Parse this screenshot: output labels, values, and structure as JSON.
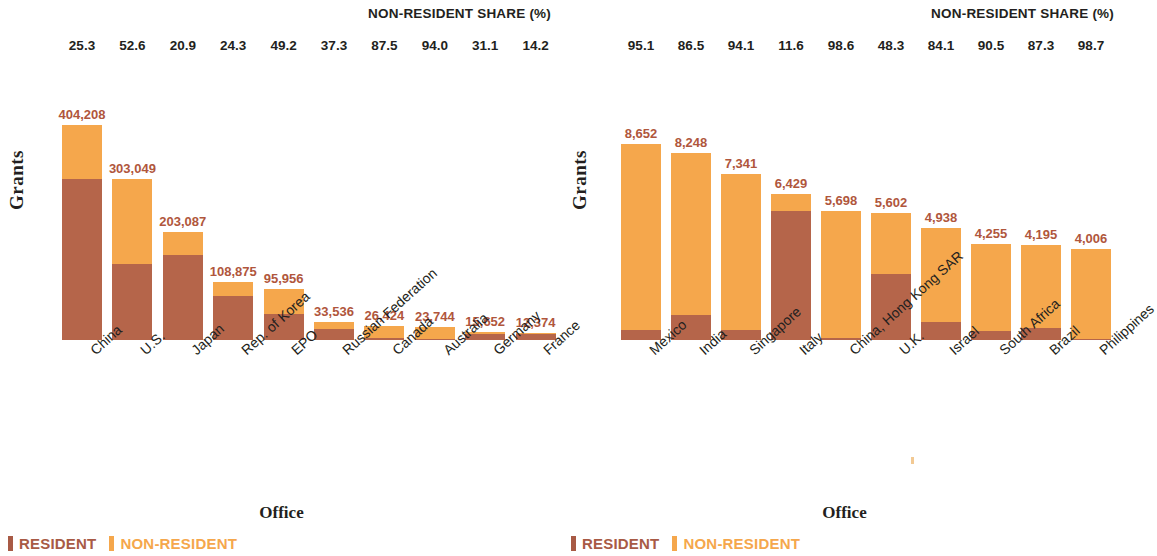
{
  "chart_data": [
    {
      "type": "bar",
      "title": "NON-RESIDENT SHARE (%)",
      "xlabel": "Office",
      "ylabel": "Grants",
      "stacked": true,
      "ylim": [
        0,
        460000
      ],
      "grid": false,
      "legend_position": "bottom-left",
      "legend": [
        "RESIDENT",
        "NON-RESIDENT"
      ],
      "colors": {
        "resident": "#b5654a",
        "non_resident": "#f5a74c"
      },
      "categories": [
        "China",
        "U.S.",
        "Japan",
        "Rep. of Korea",
        "EPO",
        "Russian Federation",
        "Canada",
        "Australia",
        "Germany",
        "France"
      ],
      "totals": [
        404208,
        303049,
        203087,
        108875,
        95956,
        33536,
        26424,
        23744,
        15652,
        12374
      ],
      "total_labels": [
        "404,208",
        "303,049",
        "203,087",
        "108,875",
        "95,956",
        "33,536",
        "26,424",
        "23,744",
        "15,652",
        "12,374"
      ],
      "non_resident_share": [
        25.3,
        52.6,
        20.9,
        24.3,
        49.2,
        37.3,
        87.5,
        94.0,
        31.1,
        14.2
      ],
      "share_labels": [
        "25.3",
        "52.6",
        "20.9",
        "24.3",
        "49.2",
        "37.3",
        "87.5",
        "94.0",
        "31.1",
        "14.2"
      ],
      "series": [
        {
          "name": "RESIDENT",
          "values": [
            301944,
            143645,
            160642,
            82418,
            48746,
            21027,
            3303,
            1425,
            10784,
            10617
          ]
        },
        {
          "name": "NON-RESIDENT",
          "values": [
            102264,
            159404,
            42445,
            26457,
            47210,
            12509,
            23121,
            22319,
            4868,
            1757
          ]
        }
      ]
    },
    {
      "type": "bar",
      "title": "NON-RESIDENT SHARE (%)",
      "xlabel": "Office",
      "ylabel": "Grants",
      "stacked": true,
      "ylim": [
        0,
        9800
      ],
      "grid": false,
      "legend_position": "bottom-left",
      "legend": [
        "RESIDENT",
        "NON-RESIDENT"
      ],
      "colors": {
        "resident": "#b5654a",
        "non_resident": "#f5a74c"
      },
      "categories": [
        "Mexico",
        "India",
        "Singapore",
        "Italy",
        "China, Hong Kong SAR",
        "U.K.",
        "Israel",
        "South Africa",
        "Brazil",
        "Philippines"
      ],
      "totals": [
        8652,
        8248,
        7341,
        6429,
        5698,
        5602,
        4938,
        4255,
        4195,
        4006
      ],
      "total_labels": [
        "8,652",
        "8,248",
        "7,341",
        "6,429",
        "5,698",
        "5,602",
        "4,938",
        "4,255",
        "4,195",
        "4,006"
      ],
      "non_resident_share": [
        95.1,
        86.5,
        94.1,
        11.6,
        98.6,
        48.3,
        84.1,
        90.5,
        87.3,
        98.7
      ],
      "share_labels": [
        "95.1",
        "86.5",
        "94.1",
        "11.6",
        "98.6",
        "48.3",
        "84.1",
        "90.5",
        "87.3",
        "98.7"
      ],
      "series": [
        {
          "name": "RESIDENT",
          "values": [
            424,
            1113,
            433,
            5683,
            80,
            2896,
            785,
            404,
            533,
            52
          ]
        },
        {
          "name": "NON-RESIDENT",
          "values": [
            8228,
            7135,
            6908,
            746,
            5618,
            2706,
            4153,
            3851,
            3662,
            3954
          ]
        }
      ]
    }
  ],
  "panels": [
    {
      "share_title": "NON-RESIDENT SHARE (%)",
      "y_title": "Grants",
      "x_title": "Office",
      "legend": {
        "resident": "RESIDENT",
        "non_resident": "NON-RESIDENT"
      }
    },
    {
      "share_title": "NON-RESIDENT SHARE (%)",
      "y_title": "Grants",
      "x_title": "Office",
      "legend": {
        "resident": "RESIDENT",
        "non_resident": "NON-RESIDENT"
      }
    }
  ]
}
